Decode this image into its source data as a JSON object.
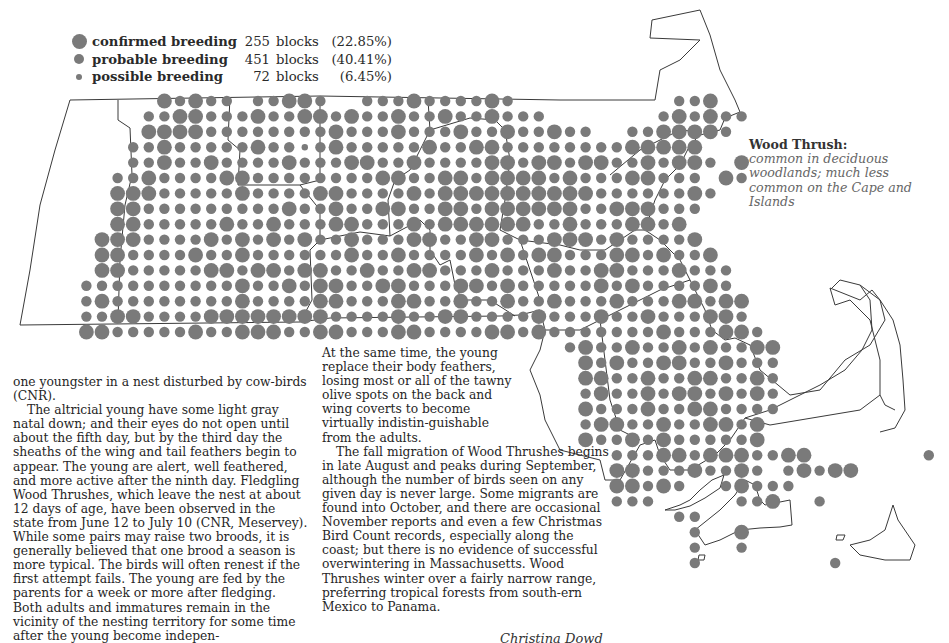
{
  "legend": {
    "items": [
      {
        "label": "confirmed breeding",
        "count": "255",
        "unit": "blocks",
        "percent": "(22.85%)",
        "dot_size": 15
      },
      {
        "label": "probable breeding",
        "count": "451",
        "unit": "blocks",
        "percent": "(40.41%)",
        "dot_size": 10
      },
      {
        "label": "possible breeding",
        "count": "72",
        "unit": "blocks",
        "percent": "(6.45%)",
        "dot_size": 6
      }
    ]
  },
  "species": {
    "name": "Wood Thrush:",
    "description": "common in deciduous woodlands; much less common on the Cape and Islands"
  },
  "map": {
    "dot_color": "#7a7a7a",
    "line_color": "#3a3a3a",
    "grid": {
      "x0": 24,
      "y0": 101,
      "dx": 15.6,
      "dy": 15.4
    },
    "radius": {
      "C": 7.4,
      "P": 5.2,
      "S": 3.2
    },
    "rows": [
      ".........CPCPP.PPCCP..PPPCPPPPCP..........PPC",
      "........PPCCPPPCPPCCPCPPCPPCPPCPPP.......PCPCPP",
      "........CCCCPPPPPPPPCPPPCPPPCPPCPPCPP..PPCCCCP",
      ".......PPCPPPPPCPPSPCPPPPPCPPCCPPPPPPPPCCCCC",
      ".......PPCPPCPPPPCPPPCCPPCPPPPCCPCCPCCPPCPCCP.C",
      "......PPCPPPPCCPPPPPPPPCCPPCCPCCCCPCPPPCCPPP.CP",
      "......CCCPPPPPCPPPPCCPPPPCPCCCCCCCCCCPPPPPPCP",
      "......CCPPPPPPPPPCPPCPPCCPPCCPCCCCCCPPCCCPPP",
      "......CCPPPPPCPPCPPPCCPPPCPCCCCCCPPCPPPCCPC",
      ".....CCCPPPPCPCPCPCPPCPPPCCPPCCPPPCCCPCPPPPC",
      ".....CCPPPPCPPCPPPPPPCPPCPPPPCPCPCCPPPCCPCPPC",
      ".....CCPPPPPCCPCCPCCPPCPPCCPPPCPPPCPPCCPPPCPPP",
      "....PPPPPPPPPPCPPCPCCPPCCPPPCCPCPPPPPCPCPPPPCP",
      "....PCPPPPPPPPCPPPPCCPPPCCPPCPPCPPCPPPCPPPCCPCC",
      "....PPCCPPPPCCCCCCCCPPPPCPPCCPPPPCPPPCPPCPPPCCP",
      "....CCPPPPPCPPCCCPPCCPPPCCPPPPCCPCPPPPPPPCPPPCCP",
      "...................................PCPPCPPCPCPPCC",
      "....................................CPCPPCCPPCPPP",
      "....................................CCPPCPPCCPPCP",
      "....................................PCPPCPCCPCPCP",
      "....................................CPPPCPPCCPPPP..............C",
      "....................................PCCPPCPPCCPC...............P",
      "....................................CPPCPCPPPPPC",
      "......................................PPPCCPCCCPPCC.......P",
      "......................................CCPPPCPPCP.PCPCC",
      "......................................CCPCP..PCPPP",
      "......................................PPP.....PPC..P",
      "..........................................PP",
      "...........................................P..C",
      "...........................................P..P",
      "...........................................P........P"
    ]
  },
  "text": {
    "left_paragraphs": [
      "one youngster in a nest disturbed by cow-birds (CNR).",
      "The altricial young have some light gray natal down; and their eyes do not open until about the fifth day, but by the third day the sheaths of the wing and tail feathers begin to appear. The young are alert, well feathered, and more active after the ninth day. Fledgling Wood Thrushes, which leave the nest at about 12 days of age, have been observed in the state from June 12 to July 10 (CNR, Meservey). While some pairs may raise two broods, it is generally believed that one brood a season is more typical. The birds will often renest if the first attempt fails. The young are fed by the parents for a week or more after fledging. Both adults and immatures remain in the vicinity of the nesting territory for some time after the young become indepen-"
    ],
    "middle_paragraphs": [
      "At the same time, the young replace their body feathers, losing most or all of the tawny olive spots on the back and wing coverts to become virtually indistin-guishable from the adults.",
      "The fall migration of Wood Thrushes begins in late August and peaks during September, although the number of birds seen on any given day is never large. Some migrants are found into October, and there are occasional November reports and even a few Christmas Bird Count records, especially along the coast; but there is no evidence of successful overwintering in Massachusetts. Wood Thrushes winter over a fairly narrow range, preferring tropical forests from south-ern Mexico to Panama."
    ],
    "author": "Christina Dowd"
  }
}
